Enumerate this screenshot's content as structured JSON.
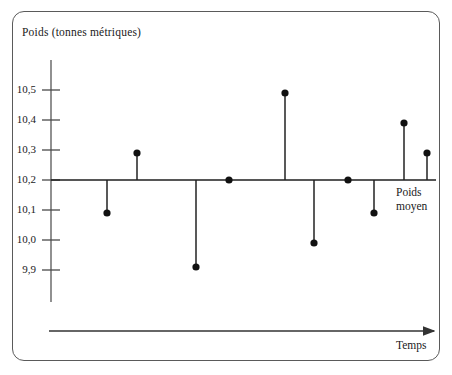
{
  "figure": {
    "frame_style": "rounded-rectangle-border",
    "border_color": "#5a5a5a",
    "background": "#ffffff"
  },
  "labels": {
    "y_caption": "Poids (tonnes métriques)",
    "x_axis": "Temps",
    "mean_line_line1": "Poids",
    "mean_line_line2": "moyen"
  },
  "axis": {
    "y_ticks": [
      "10,5",
      "10,4",
      "10,3",
      "10,2",
      "10,1",
      "10,0",
      "9,9"
    ],
    "y_tick_values": [
      10.5,
      10.4,
      10.3,
      10.2,
      10.1,
      10.0,
      9.9
    ]
  },
  "chart_data": {
    "type": "scatter",
    "title": "",
    "subtitle": "",
    "xlabel": "Temps",
    "ylabel": "Poids (tonnes métriques)",
    "x": [
      1,
      2,
      3,
      4,
      5,
      6,
      7,
      8,
      9,
      10
    ],
    "values": [
      10.09,
      10.29,
      9.91,
      10.2,
      10.49,
      9.99,
      10.2,
      10.09,
      10.39,
      10.29
    ],
    "categories": [
      "1",
      "2",
      "3",
      "4",
      "5",
      "6",
      "7",
      "8",
      "9",
      "10"
    ],
    "ylim": [
      9.85,
      10.58
    ],
    "ytick_labels": [
      "10,5",
      "10,4",
      "10,3",
      "10,2",
      "10,1",
      "10,0",
      "9,9"
    ],
    "ytick_values": [
      10.5,
      10.4,
      10.3,
      10.2,
      10.1,
      10.0,
      9.9
    ],
    "xtick_labels": [],
    "reference_line": {
      "value": 10.2,
      "label": "Poids moyen",
      "orientation": "horizontal"
    },
    "grid": false,
    "legend": false,
    "legend_position": "none",
    "marker": "filled-circle",
    "marker_color": "#111111",
    "stem_color": "#222222",
    "annotations": [
      "Poids moyen",
      "Temps"
    ],
    "note": "Deviations from the mean weight plotted over time as stems from the 10,2 reference line"
  },
  "geometry": {
    "plot_left_px": 51,
    "mean_line_y_px": 180,
    "px_per_unit": 300,
    "point_x_px": [
      107,
      137,
      196,
      229,
      285,
      314,
      348,
      374,
      404,
      427
    ],
    "y_axis_top_px": 60,
    "y_axis_bottom_px": 302,
    "mean_line_right_px": 436,
    "time_arrow_y_px": 331,
    "time_arrow_x1_px": 49,
    "time_arrow_x2_px": 434
  }
}
